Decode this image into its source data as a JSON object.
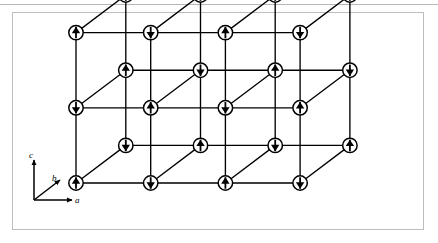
{
  "figure": {
    "background_color": "#ffffff",
    "page_background_color": "#f3f3f3",
    "frame_color": "#bdbdbd",
    "line_color": "#000000",
    "atom_fill_color": "#ffffff",
    "atom_stroke_color": "#000000",
    "arrow_color": "#000000"
  },
  "axes": {
    "c": {
      "label": "c",
      "direction": "up",
      "x1": 34,
      "y1": 200,
      "x2": 34,
      "y2": 160
    },
    "b": {
      "label": "b",
      "direction": "up-right-diagonal",
      "x1": 34,
      "y1": 200,
      "x2": 60,
      "y2": 180
    },
    "a": {
      "label": "a",
      "direction": "right",
      "x1": 34,
      "y1": 200,
      "x2": 72,
      "y2": 200
    }
  },
  "lattice": {
    "type": "rock-salt-antiferromagnet",
    "grid": {
      "na": 4,
      "nb": 2,
      "nc": 3
    },
    "origin": {
      "x": 76,
      "y": 183
    },
    "step_a": {
      "dx": 74.7,
      "dy": 0
    },
    "step_b": {
      "dx": 49.8,
      "dy": -37.6
    },
    "step_c": {
      "dx": 0,
      "dy": -75.2
    },
    "atom_radius": 7.2,
    "arrow_length": 11.5,
    "spin_rule": "alternating: spin = up when (i+j+k) is even, down when odd",
    "spin_up_symbol": "↑",
    "spin_down_symbol": "↓",
    "rows": [
      {
        "name": "back-top-row",
        "y": 31,
        "atoms": [
          {
            "x": 178,
            "spin": "up"
          },
          {
            "x": 253,
            "spin": "down"
          },
          {
            "x": 328,
            "spin": "up"
          },
          {
            "x": 403,
            "spin": "down"
          }
        ]
      },
      {
        "name": "back-middle-row",
        "y": 70,
        "atoms": [
          {
            "x": 126,
            "spin": "up"
          },
          {
            "x": 200,
            "spin": "down"
          },
          {
            "x": 275,
            "spin": "up"
          },
          {
            "x": 350,
            "spin": "down"
          }
        ]
      },
      {
        "name": "center-row",
        "y": 108,
        "atoms": [
          {
            "x": 76,
            "spin": "down"
          },
          {
            "x": 126,
            "spin": "up"
          },
          {
            "x": 150,
            "spin": "up"
          },
          {
            "x": 200,
            "spin": "down"
          },
          {
            "x": 226,
            "spin": "down"
          },
          {
            "x": 275,
            "spin": "up"
          },
          {
            "x": 300,
            "spin": "up"
          },
          {
            "x": 403,
            "spin": "down"
          }
        ]
      },
      {
        "name": "front-middle-row",
        "y": 146,
        "atoms": [
          {
            "x": 126,
            "spin": "up"
          },
          {
            "x": 200,
            "spin": "down"
          },
          {
            "x": 275,
            "spin": "up"
          },
          {
            "x": 350,
            "spin": "down"
          }
        ]
      },
      {
        "name": "front-bottom-row",
        "y": 183,
        "atoms": [
          {
            "x": 76,
            "spin": "down"
          },
          {
            "x": 150,
            "spin": "up"
          },
          {
            "x": 226,
            "spin": "down"
          },
          {
            "x": 300,
            "spin": "up"
          }
        ]
      }
    ]
  }
}
